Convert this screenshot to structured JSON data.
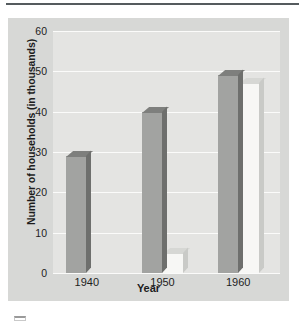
{
  "chart_data": {
    "type": "bar",
    "title": "",
    "xlabel": "Year",
    "ylabel": "Number of households (in thousands)",
    "categories": [
      "1940",
      "1950",
      "1960"
    ],
    "series": [
      {
        "name": "dark-series",
        "values": [
          29,
          40,
          49
        ],
        "color": "#a2a3a1"
      },
      {
        "name": "light-series",
        "values": [
          null,
          5,
          47
        ],
        "color": "#f7f7f5"
      }
    ],
    "ylim": [
      0,
      60
    ],
    "yticks": [
      0,
      10,
      20,
      30,
      40,
      50,
      60
    ],
    "ytick_labels": [
      "0",
      "10",
      "20",
      "30",
      "40",
      "50",
      "60"
    ],
    "grid": true,
    "legend": "none",
    "style": "3d-bars-grayscale"
  },
  "figure": {
    "background_color": "#d7d8d6",
    "plot_background_color": "#e4e4e2",
    "gridline_color": "#fbfbfa",
    "text_color": "#1d1d1d",
    "rule_color": "#555b5e"
  }
}
